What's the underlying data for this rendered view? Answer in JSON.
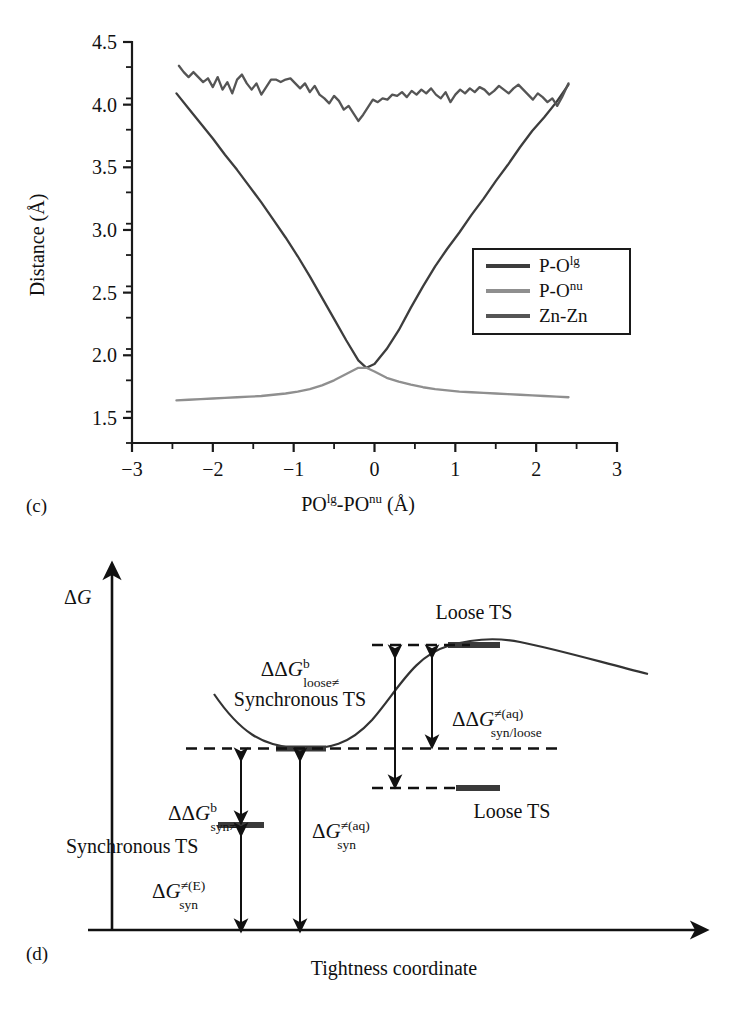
{
  "panel_c": {
    "tag": "(c)",
    "ylabel": "Distance (Å)",
    "xlabel_parts": {
      "a": "PO",
      "a_sup": "lg",
      "dash": "-",
      "b": "PO",
      "b_sup": "nu",
      "unit": " (Å)"
    },
    "xlabel": "POˡᵍ-POⁿᵘ (Å)",
    "legend": [
      {
        "label": "P-O",
        "sup": "lg",
        "color": "#3d3d3d"
      },
      {
        "label": "P-O",
        "sup": "nu",
        "color": "#8f8f8f"
      },
      {
        "label": "Zn-Zn",
        "sup": "",
        "color": "#555555"
      }
    ],
    "chart_data": {
      "type": "line",
      "title": "",
      "xlabel": "POlg-POnu (Å)",
      "ylabel": "Distance (Å)",
      "xlim": [
        -3,
        3
      ],
      "ylim": [
        1.3,
        4.5
      ],
      "xticks": [
        -3,
        -2,
        -1,
        0,
        1,
        2,
        3
      ],
      "xticklabels": [
        "−3",
        "−2",
        "−1",
        "0",
        "1",
        "2",
        "3"
      ],
      "yticks": [
        1.5,
        2.0,
        2.5,
        3.0,
        3.5,
        4.0,
        4.5
      ],
      "yticklabels": [
        "1.5",
        "2.0",
        "2.5",
        "3.0",
        "3.5",
        "4.0",
        "4.5"
      ],
      "minor_xtick_step": 0.5,
      "minor_ytick_step": 0.25,
      "grid": false,
      "legend_position": "center-right",
      "series": [
        {
          "name": "P-O lg",
          "color": "#3d3d3d",
          "x": [
            -2.45,
            -2.3,
            -2.15,
            -2.0,
            -1.85,
            -1.7,
            -1.55,
            -1.4,
            -1.25,
            -1.1,
            -0.95,
            -0.8,
            -0.65,
            -0.5,
            -0.35,
            -0.2,
            -0.1,
            0.0,
            0.15,
            0.3,
            0.45,
            0.6,
            0.75,
            0.9,
            1.05,
            1.2,
            1.35,
            1.5,
            1.65,
            1.8,
            1.95,
            2.1,
            2.25,
            2.4
          ],
          "y": [
            4.09,
            3.97,
            3.85,
            3.73,
            3.6,
            3.48,
            3.35,
            3.22,
            3.08,
            2.94,
            2.79,
            2.63,
            2.46,
            2.29,
            2.12,
            1.96,
            1.9,
            1.93,
            2.05,
            2.2,
            2.38,
            2.55,
            2.71,
            2.85,
            2.98,
            3.12,
            3.25,
            3.39,
            3.52,
            3.66,
            3.79,
            3.9,
            4.02,
            4.16
          ]
        },
        {
          "name": "P-O nu",
          "color": "#8f8f8f",
          "x": [
            -2.45,
            -2.3,
            -2.15,
            -2.0,
            -1.85,
            -1.7,
            -1.55,
            -1.4,
            -1.25,
            -1.1,
            -0.95,
            -0.8,
            -0.65,
            -0.5,
            -0.35,
            -0.2,
            -0.1,
            0.0,
            0.15,
            0.3,
            0.45,
            0.6,
            0.75,
            0.9,
            1.05,
            1.2,
            1.35,
            1.5,
            1.65,
            1.8,
            1.95,
            2.1,
            2.25,
            2.4
          ],
          "y": [
            1.64,
            1.645,
            1.65,
            1.655,
            1.66,
            1.665,
            1.67,
            1.675,
            1.685,
            1.695,
            1.71,
            1.73,
            1.76,
            1.8,
            1.85,
            1.9,
            1.9,
            1.87,
            1.82,
            1.79,
            1.765,
            1.745,
            1.73,
            1.72,
            1.71,
            1.705,
            1.7,
            1.695,
            1.69,
            1.685,
            1.68,
            1.675,
            1.67,
            1.665
          ]
        },
        {
          "name": "Zn-Zn",
          "color": "#555555",
          "x": [
            -2.42,
            -2.36,
            -2.3,
            -2.24,
            -2.18,
            -2.12,
            -2.06,
            -2.0,
            -1.94,
            -1.88,
            -1.82,
            -1.76,
            -1.7,
            -1.64,
            -1.58,
            -1.52,
            -1.46,
            -1.4,
            -1.34,
            -1.28,
            -1.22,
            -1.16,
            -1.1,
            -1.04,
            -0.98,
            -0.92,
            -0.86,
            -0.8,
            -0.74,
            -0.68,
            -0.62,
            -0.56,
            -0.5,
            -0.44,
            -0.38,
            -0.32,
            -0.26,
            -0.2,
            -0.14,
            -0.08,
            -0.02,
            0.04,
            0.1,
            0.16,
            0.22,
            0.28,
            0.34,
            0.4,
            0.46,
            0.52,
            0.58,
            0.64,
            0.7,
            0.76,
            0.82,
            0.88,
            0.94,
            1.0,
            1.06,
            1.12,
            1.18,
            1.24,
            1.3,
            1.36,
            1.42,
            1.48,
            1.54,
            1.6,
            1.66,
            1.72,
            1.78,
            1.84,
            1.9,
            1.96,
            2.02,
            2.08,
            2.14,
            2.2,
            2.26,
            2.32,
            2.4
          ],
          "y": [
            4.31,
            4.26,
            4.22,
            4.26,
            4.22,
            4.18,
            4.21,
            4.14,
            4.22,
            4.12,
            4.18,
            4.09,
            4.2,
            4.24,
            4.17,
            4.12,
            4.17,
            4.08,
            4.14,
            4.2,
            4.2,
            4.18,
            4.2,
            4.21,
            4.17,
            4.13,
            4.17,
            4.1,
            4.15,
            4.08,
            4.05,
            4.01,
            4.07,
            4.03,
            3.96,
            3.99,
            3.93,
            3.87,
            3.92,
            3.98,
            4.04,
            4.02,
            4.05,
            4.04,
            4.08,
            4.07,
            4.1,
            4.06,
            4.11,
            4.08,
            4.12,
            4.09,
            4.13,
            4.08,
            4.05,
            4.1,
            4.02,
            4.08,
            4.12,
            4.09,
            4.13,
            4.1,
            4.14,
            4.12,
            4.08,
            4.11,
            4.15,
            4.12,
            4.09,
            4.13,
            4.16,
            4.12,
            4.08,
            4.04,
            4.09,
            4.06,
            4.02,
            4.05,
            3.99,
            4.06,
            4.17
          ]
        }
      ]
    }
  },
  "panel_d": {
    "tag": "(d)",
    "yaxis_label": "ΔG",
    "xaxis_label": "Tightness coordinate",
    "labels": {
      "synchronous_ts_curve": "Synchronous TS",
      "synchronous_ts_level": "Synchronous TS",
      "loose_ts_curve": "Loose TS",
      "loose_ts_level": "Loose TS"
    },
    "annotations": [
      {
        "name": "ddg-b-loose",
        "main": "ΔΔG",
        "sup": "b",
        "sub": "loose≠"
      },
      {
        "name": "ddg-b-syn",
        "main": "ΔΔG",
        "sup": "b",
        "sub": "syn≠"
      },
      {
        "name": "ddg-aq-syn-loose",
        "main": "ΔΔG",
        "sup": "≠(aq)",
        "sub": "syn/loose"
      },
      {
        "name": "dg-aq-syn",
        "main": "ΔG",
        "sup": "≠(aq)",
        "sub": "syn"
      },
      {
        "name": "dg-e-syn",
        "main": "ΔG",
        "sup": "≠(E)",
        "sub": "syn"
      }
    ]
  }
}
